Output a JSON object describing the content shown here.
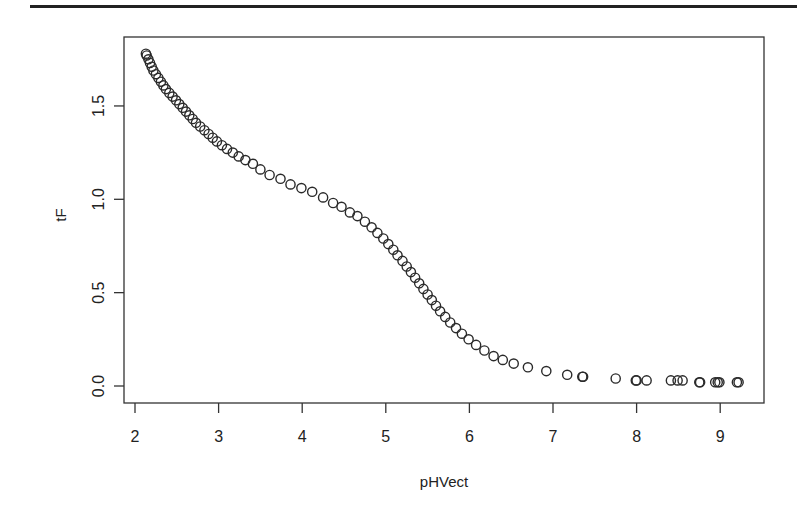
{
  "chart_data": {
    "type": "scatter",
    "title": "",
    "xlabel": "pHVect",
    "ylabel": "tF",
    "xlim": [
      1.87,
      9.52
    ],
    "ylim": [
      -0.09,
      1.87
    ],
    "x_ticks": [
      2,
      3,
      4,
      5,
      6,
      7,
      8,
      9
    ],
    "x_tick_labels": [
      "2",
      "3",
      "4",
      "5",
      "6",
      "7",
      "8",
      "9"
    ],
    "y_ticks": [
      0.0,
      0.5,
      1.0,
      1.5
    ],
    "y_tick_labels": [
      "0.0",
      "0.5",
      "1.0",
      "1.5"
    ],
    "grid": false,
    "legend": null,
    "marker": "open-circle",
    "points": [
      [
        2.13,
        1.78
      ],
      [
        2.14,
        1.77
      ],
      [
        2.16,
        1.75
      ],
      [
        2.18,
        1.73
      ],
      [
        2.2,
        1.71
      ],
      [
        2.22,
        1.69
      ],
      [
        2.25,
        1.67
      ],
      [
        2.28,
        1.65
      ],
      [
        2.31,
        1.63
      ],
      [
        2.34,
        1.61
      ],
      [
        2.37,
        1.59
      ],
      [
        2.41,
        1.57
      ],
      [
        2.45,
        1.55
      ],
      [
        2.49,
        1.53
      ],
      [
        2.53,
        1.51
      ],
      [
        2.57,
        1.49
      ],
      [
        2.61,
        1.47
      ],
      [
        2.65,
        1.45
      ],
      [
        2.69,
        1.43
      ],
      [
        2.73,
        1.41
      ],
      [
        2.78,
        1.39
      ],
      [
        2.83,
        1.37
      ],
      [
        2.88,
        1.35
      ],
      [
        2.93,
        1.33
      ],
      [
        2.98,
        1.31
      ],
      [
        3.04,
        1.29
      ],
      [
        3.1,
        1.27
      ],
      [
        3.17,
        1.25
      ],
      [
        3.24,
        1.23
      ],
      [
        3.32,
        1.21
      ],
      [
        3.41,
        1.19
      ],
      [
        3.5,
        1.16
      ],
      [
        3.61,
        1.13
      ],
      [
        3.74,
        1.11
      ],
      [
        3.86,
        1.08
      ],
      [
        3.99,
        1.06
      ],
      [
        4.12,
        1.04
      ],
      [
        4.25,
        1.01
      ],
      [
        4.37,
        0.98
      ],
      [
        4.47,
        0.96
      ],
      [
        4.57,
        0.93
      ],
      [
        4.66,
        0.91
      ],
      [
        4.75,
        0.88
      ],
      [
        4.83,
        0.85
      ],
      [
        4.9,
        0.82
      ],
      [
        4.97,
        0.79
      ],
      [
        5.03,
        0.76
      ],
      [
        5.09,
        0.73
      ],
      [
        5.14,
        0.7
      ],
      [
        5.2,
        0.67
      ],
      [
        5.25,
        0.64
      ],
      [
        5.3,
        0.61
      ],
      [
        5.35,
        0.58
      ],
      [
        5.4,
        0.55
      ],
      [
        5.45,
        0.52
      ],
      [
        5.5,
        0.49
      ],
      [
        5.55,
        0.46
      ],
      [
        5.6,
        0.43
      ],
      [
        5.65,
        0.4
      ],
      [
        5.71,
        0.37
      ],
      [
        5.77,
        0.34
      ],
      [
        5.84,
        0.31
      ],
      [
        5.91,
        0.28
      ],
      [
        5.99,
        0.25
      ],
      [
        6.08,
        0.22
      ],
      [
        6.18,
        0.19
      ],
      [
        6.29,
        0.16
      ],
      [
        6.4,
        0.14
      ],
      [
        6.53,
        0.12
      ],
      [
        6.7,
        0.1
      ],
      [
        6.92,
        0.08
      ],
      [
        7.17,
        0.06
      ],
      [
        7.35,
        0.05
      ],
      [
        7.36,
        0.05
      ],
      [
        7.75,
        0.04
      ],
      [
        7.99,
        0.03
      ],
      [
        8.0,
        0.03
      ],
      [
        8.12,
        0.03
      ],
      [
        8.41,
        0.03
      ],
      [
        8.49,
        0.03
      ],
      [
        8.55,
        0.03
      ],
      [
        8.75,
        0.02
      ],
      [
        8.76,
        0.02
      ],
      [
        8.94,
        0.02
      ],
      [
        8.97,
        0.02
      ],
      [
        8.99,
        0.02
      ],
      [
        9.2,
        0.02
      ],
      [
        9.22,
        0.02
      ]
    ]
  }
}
